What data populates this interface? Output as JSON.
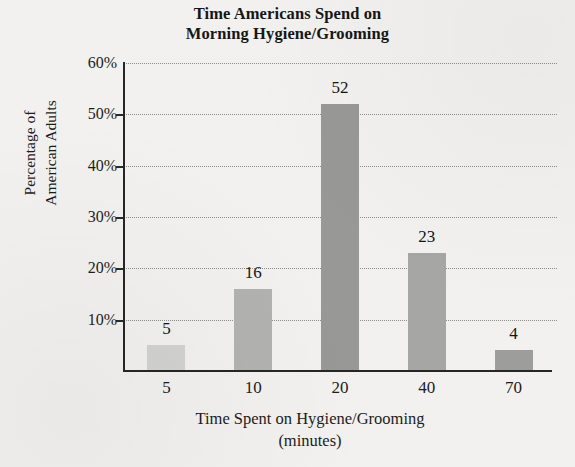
{
  "chart_data": {
    "type": "bar",
    "title": "Time Americans Spend on Morning Hygiene/Grooming",
    "title_lines": [
      "Time Americans Spend on",
      "Morning Hygiene/Grooming"
    ],
    "xlabel": "Time Spent on Hygiene/Grooming (minutes)",
    "xlabel_lines": [
      "Time Spent on Hygiene/Grooming",
      "(minutes)"
    ],
    "ylabel": "Percentage of American Adults",
    "ylabel_lines": [
      "Percentage of",
      "American Adults"
    ],
    "categories": [
      "5",
      "10",
      "20",
      "40",
      "70"
    ],
    "values": [
      5,
      16,
      52,
      23,
      4
    ],
    "value_labels": [
      "5",
      "16",
      "52",
      "23",
      "4"
    ],
    "bar_colors": [
      "#d2d2d0",
      "#b2b2b0",
      "#989897",
      "#a6a6a4",
      "#9d9d9b"
    ],
    "ylim": [
      0,
      60
    ],
    "ytick_labels": [
      "60%",
      "50%",
      "40%",
      "30%",
      "20%",
      "10%"
    ],
    "ytick_values": [
      60,
      50,
      40,
      30,
      20,
      10
    ],
    "grid": true,
    "grid_style": "dotted",
    "legend": "none",
    "background_color": "#f2f1ef",
    "axis_color": "#262626",
    "gridline_color": "#8d8d8d"
  }
}
